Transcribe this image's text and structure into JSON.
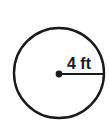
{
  "figure": {
    "name": "circle-with-radius",
    "background_color": "#ffffff",
    "stroke_color": "#1a1a1a",
    "label_color": "#1a1a1a",
    "radius_label": "4 ft",
    "units": "ft",
    "radius_value": "4"
  },
  "geometry": {
    "circle": {
      "center_x": 59,
      "center_y": 73,
      "radius_px": 45,
      "stroke_width": 2.4
    },
    "center_dot": {
      "center_x": 59,
      "center_y": 74,
      "radius_px": 3.4
    },
    "radius_segment": {
      "x1": 59,
      "y1": 74,
      "x2": 104,
      "y2": 74,
      "stroke_width": 2.2
    },
    "label_position": {
      "x": 67,
      "y": 69
    }
  },
  "chart_data": {
    "type": "diagram",
    "title": "",
    "shape": "circle",
    "annotations": [
      {
        "name": "radius",
        "label": "4 ft",
        "value": 4,
        "unit": "ft",
        "from": "center",
        "to": "circumference"
      }
    ]
  }
}
